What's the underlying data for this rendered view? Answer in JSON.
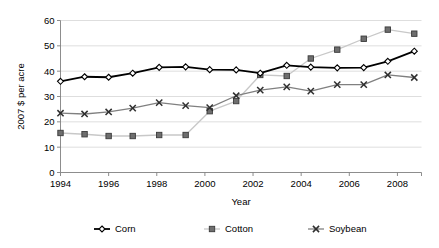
{
  "chart_data": {
    "type": "line",
    "title": "",
    "xlabel": "Year",
    "ylabel": "2007 $ per acre",
    "xlim": [
      1994,
      2009
    ],
    "ylim": [
      0,
      60
    ],
    "ytick_labels": [
      "0",
      "10",
      "20",
      "30",
      "40",
      "50",
      "60"
    ],
    "yticks": [
      0,
      10,
      20,
      30,
      40,
      50,
      60
    ],
    "xtick_labels": [
      "1994",
      "1996",
      "1998",
      "2000",
      "2002",
      "2004",
      "2006",
      "2008"
    ],
    "xticks": [
      1994,
      1996,
      1998,
      2000,
      2002,
      2004,
      2006,
      2008
    ],
    "grid": "horizontal",
    "legend_position": "bottom",
    "series": [
      {
        "name": "Corn",
        "color": "#000000",
        "marker": "diamond",
        "x": [
          1994.0,
          1995.0,
          1996.0,
          1997.0,
          1998.1,
          1999.2,
          2000.2,
          2001.3,
          2002.3,
          2003.4,
          2004.4,
          2005.5,
          2006.6,
          2007.6,
          2008.7
        ],
        "values": [
          36.0,
          37.8,
          37.6,
          39.2,
          41.5,
          41.7,
          40.6,
          40.5,
          39.2,
          42.3,
          41.6,
          41.3,
          41.4,
          43.9,
          47.9
        ]
      },
      {
        "name": "Cotton",
        "color": "#c8c8c8",
        "marker": "square",
        "x": [
          1994.0,
          1995.0,
          1996.0,
          1997.0,
          1998.1,
          1999.2,
          2000.2,
          2001.3,
          2002.3,
          2003.4,
          2004.4,
          2005.5,
          2006.6,
          2007.6,
          2008.7
        ],
        "values": [
          15.6,
          15.1,
          14.4,
          14.4,
          14.8,
          14.8,
          24.2,
          28.2,
          38.5,
          38.1,
          45.0,
          48.5,
          52.8,
          56.4,
          54.8
        ]
      },
      {
        "name": "Soybean",
        "color": "#808080",
        "marker": "x",
        "x": [
          1994.0,
          1995.0,
          1996.0,
          1997.0,
          1998.1,
          1999.2,
          2000.2,
          2001.3,
          2002.3,
          2003.4,
          2004.4,
          2005.5,
          2006.6,
          2007.6,
          2008.7
        ],
        "values": [
          23.4,
          23.1,
          23.9,
          25.4,
          27.6,
          26.4,
          25.6,
          30.3,
          32.5,
          33.8,
          32.1,
          34.7,
          34.7,
          38.5,
          37.5
        ]
      }
    ]
  },
  "legend": {
    "items": [
      {
        "label": "Corn",
        "color": "#000000",
        "marker": "diamond"
      },
      {
        "label": "Cotton",
        "color": "#c8c8c8",
        "marker": "square"
      },
      {
        "label": "Soybean",
        "color": "#808080",
        "marker": "x"
      }
    ]
  },
  "axes": {
    "x_title": "Year",
    "y_title": "2007 $ per acre"
  }
}
